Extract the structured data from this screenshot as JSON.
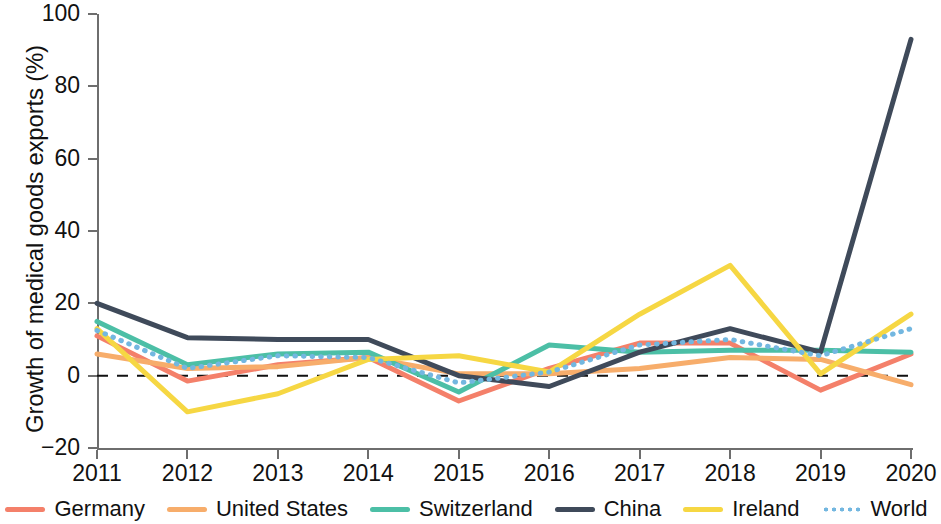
{
  "chart_data": {
    "type": "line",
    "title": "",
    "xlabel": "",
    "ylabel": "Growth of medical goods exports (%)",
    "x": [
      2011,
      2012,
      2013,
      2014,
      2015,
      2016,
      2017,
      2018,
      2019,
      2020
    ],
    "xtick_labels": [
      "2011",
      "2012",
      "2013",
      "2014",
      "2015",
      "2016",
      "2017",
      "2018",
      "2019",
      "2020"
    ],
    "ytick_labels": [
      "100",
      "80",
      "60",
      "40",
      "20",
      "0",
      "−20"
    ],
    "ytick_values": [
      100,
      80,
      60,
      40,
      20,
      0,
      -20
    ],
    "ylim": [
      -20,
      100
    ],
    "xlim": [
      2011,
      2020
    ],
    "grid": false,
    "zero_line": true,
    "zero_line_style": "dashed",
    "zero_line_color": "#111111",
    "legend_position": "bottom",
    "series": [
      {
        "name": "Germany",
        "color": "#f4806a",
        "style": "solid",
        "values": [
          11,
          -1.5,
          3,
          5,
          -7,
          2,
          9,
          9,
          -4,
          6
        ]
      },
      {
        "name": "United States",
        "color": "#f7ad6b",
        "style": "solid",
        "values": [
          6,
          2,
          2.5,
          5,
          0.5,
          0.5,
          2,
          5,
          4.5,
          -2.5
        ]
      },
      {
        "name": "Switzerland",
        "color": "#4cbfa6",
        "style": "solid",
        "values": [
          15,
          3,
          6,
          6.5,
          -4.5,
          8.5,
          6.5,
          7,
          7,
          6.5
        ]
      },
      {
        "name": "China",
        "color": "#3f4a5a",
        "style": "solid",
        "values": [
          20,
          10.5,
          10,
          10,
          0,
          -3,
          6.5,
          13,
          6.5,
          93
        ]
      },
      {
        "name": "Ireland",
        "color": "#f6d743",
        "style": "solid",
        "values": [
          13,
          -10,
          -5,
          4.5,
          5.5,
          1,
          17,
          30.5,
          0.5,
          17
        ]
      },
      {
        "name": "World",
        "color": "#73b7e0",
        "style": "dotted",
        "values": [
          12.5,
          2,
          5.5,
          5,
          -2,
          1,
          8.5,
          10,
          5.5,
          13
        ]
      }
    ]
  }
}
